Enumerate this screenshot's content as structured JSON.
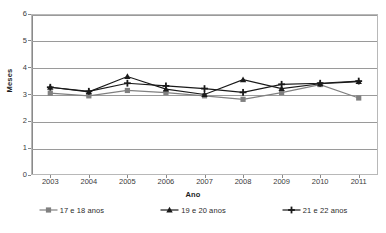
{
  "chart_data": {
    "type": "line",
    "title": "",
    "xlabel": "Ano",
    "ylabel": "Meses",
    "categories": [
      "2003",
      "2004",
      "2005",
      "2006",
      "2007",
      "2008",
      "2009",
      "2010",
      "2011"
    ],
    "x": [
      2003,
      2004,
      2005,
      2006,
      2007,
      2008,
      2009,
      2010,
      2011
    ],
    "ylim": [
      0,
      6
    ],
    "yticks": [
      0,
      1,
      2,
      3,
      4,
      5,
      6
    ],
    "ytick_labels": [
      "0",
      "1",
      "2",
      "3",
      "4",
      "5",
      "6"
    ],
    "grid": "horizontal",
    "legend_position": "bottom",
    "series": [
      {
        "name": "17 e 18 anos",
        "color": "#808080",
        "marker": "square",
        "values": [
          3.05,
          2.95,
          3.15,
          3.07,
          2.95,
          2.82,
          3.07,
          3.37,
          2.87
        ]
      },
      {
        "name": "19 e 20 anos",
        "color": "#1a1a1a",
        "marker": "triangle",
        "values": [
          3.27,
          3.1,
          3.67,
          3.2,
          3.0,
          3.55,
          3.22,
          3.4,
          3.48
        ]
      },
      {
        "name": "21 e 22 anos",
        "color": "#1a1a1a",
        "marker": "cross",
        "values": [
          3.27,
          3.12,
          3.42,
          3.32,
          3.22,
          3.08,
          3.38,
          3.42,
          3.5
        ]
      }
    ]
  },
  "legend": {
    "items": [
      {
        "label": "17 e 18 anos"
      },
      {
        "label": "19 e 20 anos"
      },
      {
        "label": "21 e 22 anos"
      }
    ]
  },
  "axes": {
    "y_title": "Meses",
    "x_title": "Ano"
  }
}
